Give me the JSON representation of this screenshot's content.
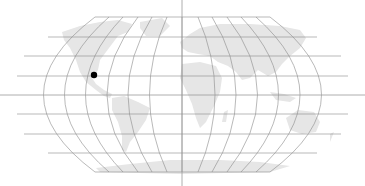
{
  "map": {
    "projection": "robinson-like world map",
    "background": "#ffffff",
    "land_color": "#e6e6e6",
    "graticule_color": "#8a8a8a",
    "axis_color": "#9a9a9a",
    "marker": {
      "label": "location marker",
      "color": "#000000",
      "x": 94,
      "y": 75,
      "region": "western Mexico"
    }
  }
}
